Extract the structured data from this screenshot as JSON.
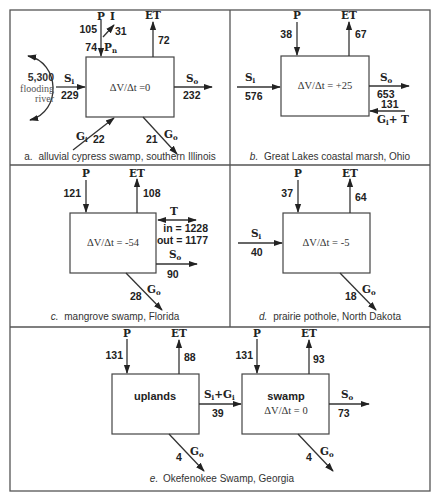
{
  "diagram": {
    "type": "water-budget-diagrams",
    "equation_prefix": "ΔV/Δt",
    "panels": {
      "a": {
        "letter": "a.",
        "caption": "alluvial cypress swamp, southern Illinois",
        "change": "ΔV/Δt =0",
        "P": {
          "label": "P",
          "value": "105"
        },
        "I": {
          "label": "I",
          "value": "31"
        },
        "Pn": {
          "label": "P",
          "sub": "n",
          "value": "74"
        },
        "ET": {
          "label": "ET",
          "value": "72"
        },
        "Si": {
          "label": "S",
          "sub": "i",
          "value": "229"
        },
        "So": {
          "label": "S",
          "sub": "o",
          "value": "232"
        },
        "Gi": {
          "label": "G",
          "sub": "i",
          "value": "22"
        },
        "Go": {
          "label": "G",
          "sub": "o",
          "value": "21"
        },
        "river": {
          "value": "5,300",
          "line1": "flooding",
          "line2": "river"
        }
      },
      "b": {
        "letter": "b.",
        "caption": "Great Lakes coastal marsh, Ohio",
        "change": "ΔV/Δt = +25",
        "P": {
          "label": "P",
          "value": "38"
        },
        "ET": {
          "label": "ET",
          "value": "67"
        },
        "Si": {
          "label": "S",
          "sub": "i",
          "value": "576"
        },
        "So": {
          "label": "S",
          "sub": "o",
          "value": "653"
        },
        "GiT": {
          "label": "G",
          "sub": "i",
          "suffix": "+ T",
          "value": "131"
        }
      },
      "c": {
        "letter": "c.",
        "caption": "mangrove swamp, Florida",
        "change": "ΔV/Δt = -54",
        "P": {
          "label": "P",
          "value": "121"
        },
        "ET": {
          "label": "ET",
          "value": "108"
        },
        "T": {
          "label": "T",
          "in": "in = 1228",
          "out": "out = 1177"
        },
        "So": {
          "label": "S",
          "sub": "o",
          "value": "90"
        },
        "Go": {
          "label": "G",
          "sub": "o",
          "value": "28"
        }
      },
      "d": {
        "letter": "d.",
        "caption": "prairie pothole, North Dakota",
        "change": "ΔV/Δt = -5",
        "P": {
          "label": "P",
          "value": "37"
        },
        "ET": {
          "label": "ET",
          "value": "64"
        },
        "Si": {
          "label": "S",
          "sub": "i",
          "value": "40"
        },
        "Go": {
          "label": "G",
          "sub": "o",
          "value": "18"
        }
      },
      "e": {
        "letter": "e.",
        "caption": "Okefenokee Swamp, Georgia",
        "uplands": {
          "name": "uplands",
          "P": {
            "label": "P",
            "value": "131"
          },
          "ET": {
            "label": "ET",
            "value": "88"
          },
          "Go": {
            "label": "G",
            "sub": "o",
            "value": "4"
          }
        },
        "transfer": {
          "label1": "S",
          "sub1": "i",
          "plus": "+G",
          "sub2": "i",
          "value": "39"
        },
        "swamp": {
          "name": "swamp",
          "change": "ΔV/Δt  = 0",
          "P": {
            "label": "P",
            "value": "131"
          },
          "ET": {
            "label": "ET",
            "value": "93"
          },
          "So": {
            "label": "S",
            "sub": "o",
            "value": "73"
          },
          "Go": {
            "label": "G",
            "sub": "o",
            "value": "4"
          }
        }
      }
    }
  }
}
